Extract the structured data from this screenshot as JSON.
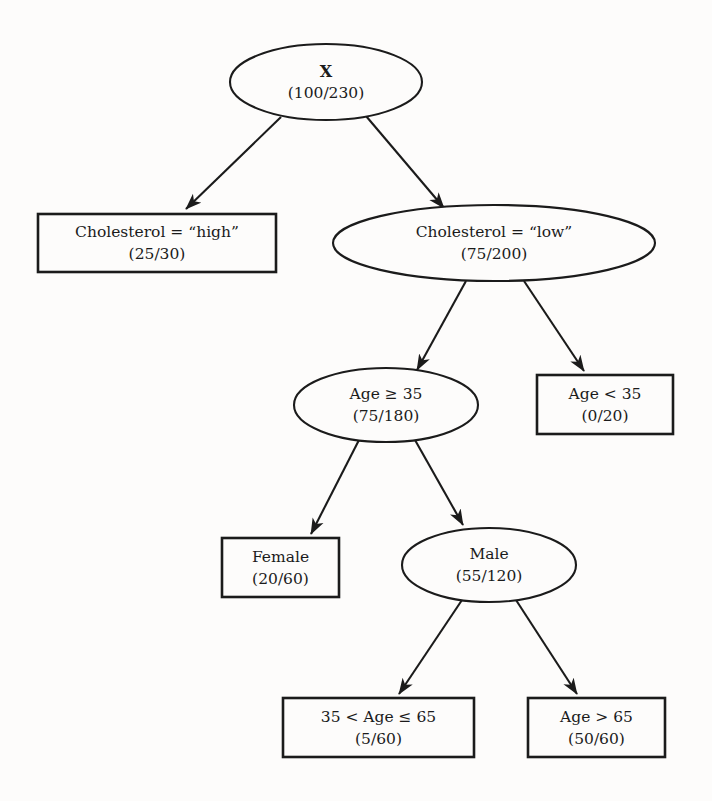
{
  "diagram": {
    "type": "decision-tree",
    "title": "",
    "background_color": "#fdfcfb",
    "line_color": "#1b1b1b",
    "text_color": "#1b1b1b",
    "nodes": [
      {
        "id": "root",
        "shape": "ellipse",
        "label": "X",
        "count": "(100/230)",
        "bold_label": true,
        "cx": 326,
        "cy": 82,
        "rx": 96,
        "ry": 38
      },
      {
        "id": "chol_high",
        "shape": "rect",
        "label": "Cholesterol = “high”",
        "count": "(25/30)",
        "bold_label": false,
        "x": 38,
        "y": 214,
        "w": 238,
        "h": 58
      },
      {
        "id": "chol_low",
        "shape": "ellipse",
        "label": "Cholesterol = “low”",
        "count": "(75/200)",
        "bold_label": false,
        "cx": 494,
        "cy": 243,
        "rx": 161,
        "ry": 38
      },
      {
        "id": "age_ge_35",
        "shape": "ellipse",
        "label": "Age ≥ 35",
        "count": "(75/180)",
        "bold_label": false,
        "cx": 386,
        "cy": 405,
        "rx": 92,
        "ry": 37
      },
      {
        "id": "age_lt_35",
        "shape": "rect",
        "label": "Age < 35",
        "count": "(0/20)",
        "bold_label": false,
        "x": 537,
        "y": 375,
        "w": 136,
        "h": 59
      },
      {
        "id": "female",
        "shape": "rect",
        "label": "Female",
        "count": "(20/60)",
        "bold_label": false,
        "x": 222,
        "y": 538,
        "w": 117,
        "h": 59
      },
      {
        "id": "male",
        "shape": "ellipse",
        "label": "Male",
        "count": "(55/120)",
        "bold_label": false,
        "cx": 489,
        "cy": 565,
        "rx": 87,
        "ry": 37
      },
      {
        "id": "age_35_65",
        "shape": "rect",
        "label": "35 < Age ≤ 65",
        "count": "(5/60)",
        "bold_label": false,
        "x": 283,
        "y": 698,
        "w": 191,
        "h": 59
      },
      {
        "id": "age_gt_65",
        "shape": "rect",
        "label": "Age > 65",
        "count": "(50/60)",
        "bold_label": false,
        "x": 528,
        "y": 698,
        "w": 137,
        "h": 59
      }
    ],
    "edges": [
      {
        "id": "edge-root-chol-high",
        "from": "root",
        "to": "chol_high",
        "x1": 281,
        "y1": 117,
        "x2": 186,
        "y2": 209
      },
      {
        "id": "edge-root-chol-low",
        "from": "root",
        "to": "chol_low",
        "x1": 366,
        "y1": 116,
        "x2": 444,
        "y2": 208
      },
      {
        "id": "edge-chol-low-age-ge-35",
        "from": "chol_low",
        "to": "age_ge_35",
        "x1": 466,
        "y1": 281,
        "x2": 417,
        "y2": 370
      },
      {
        "id": "edge-chol-low-age-lt-35",
        "from": "chol_low",
        "to": "age_lt_35",
        "x1": 524,
        "y1": 281,
        "x2": 584,
        "y2": 371
      },
      {
        "id": "edge-age-ge-35-female",
        "from": "age_ge_35",
        "to": "female",
        "x1": 359,
        "y1": 440,
        "x2": 311,
        "y2": 534
      },
      {
        "id": "edge-age-ge-35-male",
        "from": "age_ge_35",
        "to": "male",
        "x1": 415,
        "y1": 440,
        "x2": 463,
        "y2": 525
      },
      {
        "id": "edge-male-age-35-65",
        "from": "male",
        "to": "age_35_65",
        "x1": 462,
        "y1": 600,
        "x2": 399,
        "y2": 694
      },
      {
        "id": "edge-male-age-gt-65",
        "from": "male",
        "to": "age_gt_65",
        "x1": 516,
        "y1": 600,
        "x2": 577,
        "y2": 694
      }
    ]
  }
}
